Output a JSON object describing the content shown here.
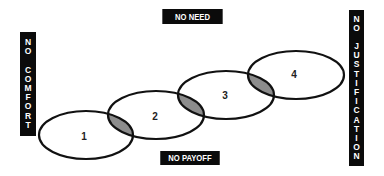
{
  "labels": {
    "top": "NO NEED",
    "bottom": "NO PAYOFF",
    "left": "NO COMFORT",
    "right": "NO JUSTIFICATION"
  },
  "stages": [
    {
      "label": "1"
    },
    {
      "label": "2"
    },
    {
      "label": "3"
    },
    {
      "label": "4"
    }
  ],
  "colors": {
    "ellipse_stroke": "#111111",
    "overlap_fill": "#8c8c8c",
    "label_bg": "#0b0b0b",
    "label_text": "#ffffff"
  }
}
